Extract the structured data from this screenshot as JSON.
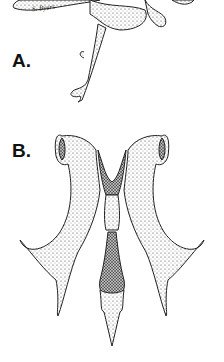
{
  "figure": {
    "panels": [
      {
        "label": "A.",
        "description": "stippled illustration of curved structure with descending stalk"
      },
      {
        "label": "B.",
        "description": "stippled illustration of paired curved lobes with central stalk"
      }
    ],
    "signature": "S. Byers"
  }
}
